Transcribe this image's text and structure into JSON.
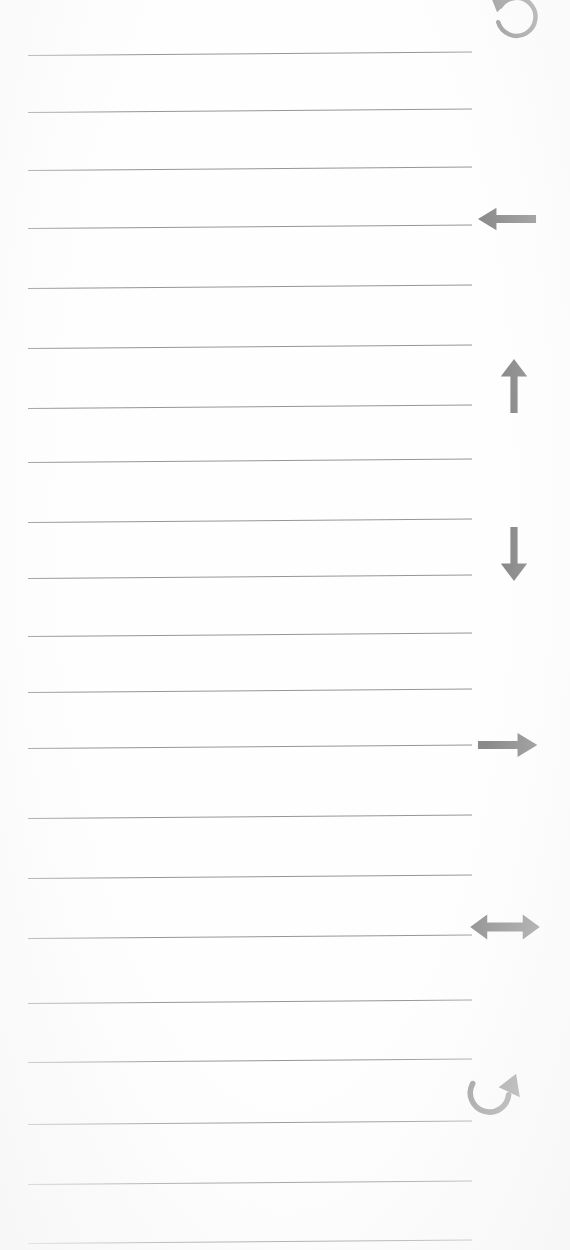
{
  "page": {
    "kind": "scanned-lined-notepad-page",
    "width": 570,
    "height": 1250,
    "background_color": "#fefefe",
    "text_content": "",
    "note": "Blank ruled paper; no handwriting or printed text present."
  },
  "rules": {
    "color": "#8d8d8d",
    "thickness_px": 1.4,
    "x_start": 28,
    "x_end": 472,
    "skew_deg": -0.45,
    "count": 21,
    "y_positions": [
      55,
      112,
      170,
      228,
      288,
      348,
      408,
      462,
      522,
      578,
      636,
      692,
      748,
      818,
      878,
      938,
      1003,
      1062,
      1124,
      1184,
      1243
    ]
  },
  "margin_icons": {
    "color": "#8a8a8a",
    "items": [
      {
        "name": "undo-circular-arrow-icon",
        "label": "Undo",
        "glyph": "counter-clockwise-circular-arrow",
        "x": 487,
        "y": -8,
        "size": 56
      },
      {
        "name": "arrow-left-icon",
        "label": "Left",
        "glyph": "left-arrow",
        "x": 474,
        "y": 186,
        "size": 66
      },
      {
        "name": "arrow-up-icon",
        "label": "Up",
        "glyph": "up-arrow",
        "x": 484,
        "y": 356,
        "size": 60
      },
      {
        "name": "arrow-down-icon",
        "label": "Down",
        "glyph": "down-arrow",
        "x": 484,
        "y": 524,
        "size": 60
      },
      {
        "name": "arrow-right-icon",
        "label": "Right",
        "glyph": "right-arrow",
        "x": 474,
        "y": 712,
        "size": 66
      },
      {
        "name": "arrow-left-right-icon",
        "label": "Left and right",
        "glyph": "double-headed-horizontal-arrow",
        "x": 468,
        "y": 890,
        "size": 74
      },
      {
        "name": "redo-curved-arrow-icon",
        "label": "Redo",
        "glyph": "clockwise-curved-arrow",
        "x": 464,
        "y": 1060,
        "size": 62
      }
    ]
  }
}
